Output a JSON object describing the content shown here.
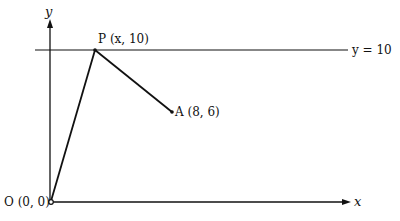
{
  "diagram": {
    "type": "coordinate-geometry",
    "axes": {
      "x_label": "x",
      "y_label": "y"
    },
    "line": {
      "label": "y = 10",
      "equation": "y = 10"
    },
    "points": {
      "origin": {
        "label": "O (0, 0)",
        "name": "O",
        "coords": "(0, 0)"
      },
      "P": {
        "label": "P (x, 10)",
        "name": "P",
        "coords": "(x, 10)"
      },
      "A": {
        "label": "A (8, 6)",
        "name": "A",
        "coords": "(8, 6)"
      }
    },
    "segments": [
      "OP",
      "PA"
    ],
    "colors": {
      "stroke": "#111111",
      "background": "#ffffff"
    }
  }
}
